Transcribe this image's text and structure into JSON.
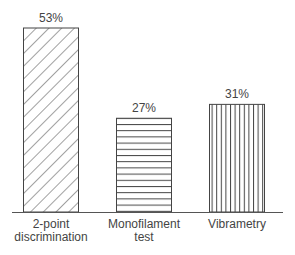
{
  "chart_data": {
    "type": "bar",
    "title": "",
    "xlabel": "",
    "ylabel": "",
    "ylim": [
      0,
      53
    ],
    "grid": false,
    "legend": null,
    "categories": [
      "2-point discrimination",
      "Monofilament test",
      "Vibrametry"
    ],
    "category_lines": [
      [
        "2-point",
        "discrimination"
      ],
      [
        "Monofilament",
        "test"
      ],
      [
        "Vibrametry"
      ]
    ],
    "values": [
      53,
      27,
      31
    ],
    "value_labels": [
      "53%",
      "27%",
      "31%"
    ],
    "patterns": [
      "diagonal",
      "horizontal",
      "vertical"
    ]
  },
  "style": {
    "stroke": "#444444",
    "background": "#ffffff"
  }
}
